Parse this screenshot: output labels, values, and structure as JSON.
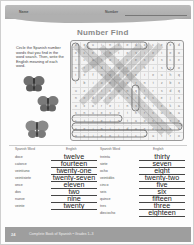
{
  "header": {
    "name_label": "Name",
    "number_label": "Number"
  },
  "title": "Number Find",
  "instructions": "Circle the Spanish number words that you find in the word search. Then, write the English meaning of each word.",
  "grid": {
    "rows": [
      "vquincedocexd",
      "eceintesieteo",
      "icatorcesdsce",
      "nrtdiecihisvo",
      "tefnoveeieuhq",
      "ibioncerntzbx",
      "uzcteonqtrsdq",
      "nedvoinidsejx",
      "oxoreinsiteka",
      "snuevetnrsuoa",
      "ctreintaostse",
      "veintidosxzse",
      "ovienticuatro"
    ]
  },
  "columns": {
    "left": {
      "spanish_header": "Spanish Word",
      "english_header": "English"
    },
    "right": {
      "spanish_header": "Spanish Word",
      "english_header": "English"
    }
  },
  "left_words": [
    {
      "spanish": "doce",
      "english": "twelve"
    },
    {
      "spanish": "catorce",
      "english": "fourteen"
    },
    {
      "spanish": "veintiuno",
      "english": "twenty-one"
    },
    {
      "spanish": "veintisiete",
      "english": "twenty-seven"
    },
    {
      "spanish": "once",
      "english": "eleven"
    },
    {
      "spanish": "dos",
      "english": "two"
    },
    {
      "spanish": "nueve",
      "english": "nine"
    },
    {
      "spanish": "veinte",
      "english": "twenty"
    }
  ],
  "right_words": [
    {
      "spanish": "treinta",
      "english": "thirty"
    },
    {
      "spanish": "siete",
      "english": "seven"
    },
    {
      "spanish": "ocho",
      "english": "eight"
    },
    {
      "spanish": "veintidós",
      "english": "twenty-two"
    },
    {
      "spanish": "cinco",
      "english": "five"
    },
    {
      "spanish": "seis",
      "english": "six"
    },
    {
      "spanish": "quince",
      "english": "fifteen"
    },
    {
      "spanish": "tres",
      "english": "three"
    },
    {
      "spanish": "dieciocho",
      "english": "eighteen"
    }
  ],
  "footer": {
    "page_number": "24",
    "book_title": "Complete Book of Spanish • Grades 1–3"
  },
  "colors": {
    "header_band": "#a9a9a9",
    "footer_band": "#9e9e9e",
    "title_text": "#8a8a8a"
  }
}
